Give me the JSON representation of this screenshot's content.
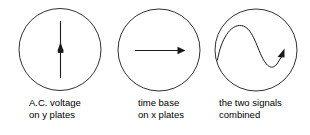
{
  "diagram": {
    "stroke_color": "#1a1a1a",
    "background_color": "#ffffff",
    "panels": [
      {
        "id": "ac-voltage-y-plates",
        "trace_name": "vertical-line-trace",
        "trace_description": "vertical line with upward arrowhead at centre",
        "caption_line1": "A.C. voltage",
        "caption_line2": "on y plates"
      },
      {
        "id": "time-base-x-plates",
        "trace_name": "horizontal-arrow-trace",
        "trace_description": "horizontal line with rightward arrowhead",
        "caption_line1": "time base",
        "caption_line2": "on x plates"
      },
      {
        "id": "two-signals-combined",
        "trace_name": "sine-wave-trace",
        "trace_description": "sine wave rising to arrowhead at right",
        "caption_line1": "the two signals",
        "caption_line2": "combined"
      }
    ]
  }
}
